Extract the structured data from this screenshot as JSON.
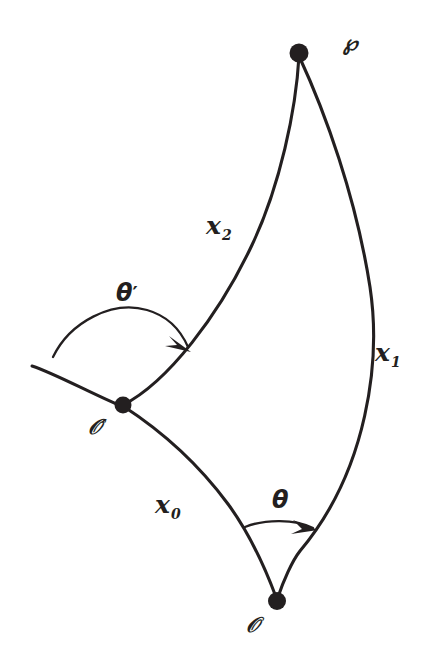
{
  "figure": {
    "type": "geometry-diagram",
    "background_color": "#ffffff",
    "ink_color": "#231f20"
  },
  "points": {
    "p": {
      "label": "℘",
      "x": 299,
      "y": 53,
      "label_x": 343,
      "label_y": 32
    },
    "o_prime": {
      "label": "𝒪′",
      "x": 123,
      "y": 405,
      "label_x": 88,
      "label_y": 416
    },
    "o": {
      "label": "𝒪",
      "x": 277,
      "y": 601,
      "label_x": 246,
      "label_y": 614
    }
  },
  "curves": {
    "x2": {
      "label": "𝒙",
      "subscript": "2",
      "label_x": 206,
      "label_y": 213,
      "from": "o_prime",
      "to": "p"
    },
    "x1": {
      "label": "𝒙",
      "subscript": "1",
      "label_x": 375,
      "label_y": 340,
      "from": "p",
      "to": "o"
    },
    "x0": {
      "label": "𝒙",
      "subscript": "0",
      "label_x": 155,
      "label_y": 492,
      "from": "o_prime",
      "to": "o"
    }
  },
  "angles": {
    "theta_prime": {
      "label": "θ",
      "prime": "′",
      "label_x": 116,
      "label_y": 281,
      "vertex": "o_prime"
    },
    "theta": {
      "label": "θ",
      "prime": "",
      "label_x": 272,
      "label_y": 488,
      "vertex": "o"
    }
  },
  "geometry": {
    "path_x2": "M 123 405 C 168 382, 219 315, 252 245 C 280 186, 296 110, 299 56",
    "path_x1": "M 299 56 C 325 112, 356 197, 370 287 C 381 360, 368 470, 300 551 C 292 561, 283 582, 278 597",
    "path_x0": "M 123 406 C 160 430, 197 462, 228 504 C 250 534, 267 573, 276 597",
    "path_tail": "M 32 366 C 56 374, 88 392, 121 406",
    "path_arc_theta_prime": "M 53 357 C 70 322, 112 300, 147 310 C 168 316, 181 331, 188 347",
    "path_arc_theta": "M 245 527 C 265 519, 295 519, 313 528",
    "arrow_theta_prime": "M 191 352 L 169 336 L 177 345 L 165 346 Z",
    "arrow_theta": "M 318 530 L 293 520 L 302 529 L 291 534 Z",
    "dot_radius_p": 9.5,
    "dot_radius_o_prime": 8.5,
    "dot_radius_o": 9.0
  }
}
